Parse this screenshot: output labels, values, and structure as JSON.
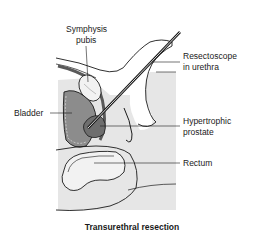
{
  "figure": {
    "caption": "Transurethral resection",
    "labels": {
      "symphysis_line1": "Symphysis",
      "symphysis_line2": "pubis",
      "resectoscope_line1": "Resectoscope",
      "resectoscope_line2": "in urethra",
      "bladder": "Bladder",
      "prostate_line1": "Hypertrophic",
      "prostate_line2": "prostate",
      "rectum": "Rectum"
    },
    "colors": {
      "background": "#ffffff",
      "pelvic_region": "#e6e6e6",
      "bladder_fill": "#8c8c8c",
      "prostate_fill": "#6e6e6e",
      "bone_fill": "#f2f2f2",
      "outline": "#1a1a1a"
    }
  }
}
